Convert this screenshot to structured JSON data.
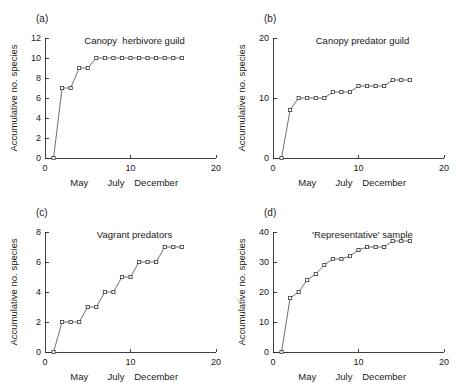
{
  "figure": {
    "ylabel": "Accumulative no. species",
    "month_labels": [
      "May",
      "July",
      "December"
    ],
    "month_positions": [
      4,
      8.3,
      13
    ],
    "xlim": [
      0,
      20
    ],
    "x_ticks": [
      0,
      10,
      20
    ],
    "marker": "open-square",
    "line_color": "#4a4a4a",
    "marker_fill": "#ffffff"
  },
  "chart_data": [
    {
      "type": "line",
      "panel": "(a)",
      "title": "Canopy  herbivore guild",
      "xlabel": "",
      "ylabel": "Accumulative no. species",
      "xlim": [
        0,
        20
      ],
      "ylim": [
        0,
        12
      ],
      "x_ticks": [
        0,
        10,
        20
      ],
      "y_ticks": [
        0,
        2,
        4,
        6,
        8,
        10,
        12
      ],
      "grid": false,
      "legend": "none",
      "x": [
        1,
        2,
        3,
        4,
        5,
        6,
        7,
        8,
        9,
        10,
        11,
        12,
        13,
        14,
        15,
        16
      ],
      "values": [
        0,
        7,
        7,
        9,
        9,
        10,
        10,
        10,
        10,
        10,
        10,
        10,
        10,
        10,
        10,
        10
      ]
    },
    {
      "type": "line",
      "panel": "(b)",
      "title": "Canopy predator guild",
      "xlabel": "",
      "ylabel": "Accumulative no. species",
      "xlim": [
        0,
        20
      ],
      "ylim": [
        0,
        20
      ],
      "x_ticks": [
        0,
        10,
        20
      ],
      "y_ticks": [
        0,
        10,
        20
      ],
      "grid": false,
      "legend": "none",
      "x": [
        1,
        2,
        3,
        4,
        5,
        6,
        7,
        8,
        9,
        10,
        11,
        12,
        13,
        14,
        15,
        16
      ],
      "values": [
        0,
        8,
        10,
        10,
        10,
        10,
        11,
        11,
        11,
        12,
        12,
        12,
        12,
        13,
        13,
        13
      ]
    },
    {
      "type": "line",
      "panel": "(c)",
      "title": "Vagrant predators",
      "xlabel": "",
      "ylabel": "Accumulative no. species",
      "xlim": [
        0,
        20
      ],
      "ylim": [
        0,
        8
      ],
      "x_ticks": [
        0,
        10,
        20
      ],
      "y_ticks": [
        0,
        2,
        4,
        6,
        8
      ],
      "grid": false,
      "legend": "none",
      "x": [
        1,
        2,
        3,
        4,
        5,
        6,
        7,
        8,
        9,
        10,
        11,
        12,
        13,
        14,
        15,
        16
      ],
      "values": [
        0,
        2,
        2,
        2,
        3,
        3,
        4,
        4,
        5,
        5,
        6,
        6,
        6,
        7,
        7,
        7
      ]
    },
    {
      "type": "line",
      "panel": "(d)",
      "title": "'Representative' sample",
      "xlabel": "",
      "ylabel": "Accumulative no. species",
      "xlim": [
        0,
        20
      ],
      "ylim": [
        0,
        40
      ],
      "x_ticks": [
        0,
        10,
        20
      ],
      "y_ticks": [
        0,
        10,
        20,
        30,
        40
      ],
      "grid": false,
      "legend": "none",
      "x": [
        1,
        2,
        3,
        4,
        5,
        6,
        7,
        8,
        9,
        10,
        11,
        12,
        13,
        14,
        15,
        16
      ],
      "values": [
        0,
        18,
        20,
        24,
        26,
        29,
        31,
        31,
        32,
        34,
        35,
        35,
        35,
        37,
        37,
        37
      ]
    }
  ]
}
